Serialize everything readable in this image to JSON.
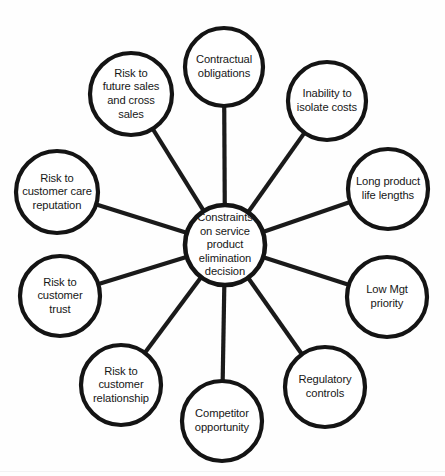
{
  "diagram": {
    "type": "spider-hub-and-spoke",
    "title": "Constraints on service product elimination decision",
    "background_color": "#fefefe",
    "stroke_color": "#141414",
    "text_color": "#171717",
    "width": 445,
    "height": 476,
    "center": {
      "id": "center",
      "label": "Constraints\non service\nproduct\nelimination\ndecision",
      "cx": 225,
      "cy": 245,
      "r": 40
    },
    "nodes": [
      {
        "id": "contractual-obligations",
        "label": "Contractual\nobligations",
        "cx": 224,
        "cy": 67,
        "r": 39,
        "position": "top"
      },
      {
        "id": "inability-to-isolate-costs",
        "label": "Inability to\nisolate costs",
        "cx": 327,
        "cy": 101,
        "r": 39,
        "position": "top-right"
      },
      {
        "id": "long-product-life-lengths",
        "label": "Long product\nlife lengths",
        "cx": 388,
        "cy": 189,
        "r": 40,
        "position": "right-upper"
      },
      {
        "id": "low-mgt-priority",
        "label": "Low Mgt\npriority",
        "cx": 387,
        "cy": 297,
        "r": 40,
        "position": "right-lower"
      },
      {
        "id": "regulatory-controls",
        "label": "Regulatory\ncontrols",
        "cx": 325,
        "cy": 387,
        "r": 40,
        "position": "bottom-right"
      },
      {
        "id": "competitor-opportunity",
        "label": "Competitor\nopportunity",
        "cx": 222,
        "cy": 421,
        "r": 40,
        "position": "bottom"
      },
      {
        "id": "risk-to-customer-relationship",
        "label": "Risk to\ncustomer\nrelationship",
        "cx": 121,
        "cy": 385,
        "r": 40,
        "position": "bottom-left"
      },
      {
        "id": "risk-to-customer-trust",
        "label": "Risk to\ncustomer\ntrust",
        "cx": 60,
        "cy": 296,
        "r": 40,
        "position": "left-lower"
      },
      {
        "id": "risk-to-customer-care-reputation",
        "label": "Risk to\ncustomer care\nreputation",
        "cx": 57,
        "cy": 192,
        "r": 41,
        "position": "left-upper"
      },
      {
        "id": "risk-to-future-sales-and-cross-sales",
        "label": "Risk to\nfuture sales\nand cross\nsales",
        "cx": 131,
        "cy": 94,
        "r": 41,
        "position": "top-left"
      }
    ],
    "edges": [
      {
        "id": "edge-contractual-obligations",
        "from": "center",
        "to": "contractual-obligations"
      },
      {
        "id": "edge-inability-to-isolate-costs",
        "from": "center",
        "to": "inability-to-isolate-costs"
      },
      {
        "id": "edge-long-product-life-lengths",
        "from": "center",
        "to": "long-product-life-lengths"
      },
      {
        "id": "edge-low-mgt-priority",
        "from": "center",
        "to": "low-mgt-priority"
      },
      {
        "id": "edge-regulatory-controls",
        "from": "center",
        "to": "regulatory-controls"
      },
      {
        "id": "edge-competitor-opportunity",
        "from": "center",
        "to": "competitor-opportunity"
      },
      {
        "id": "edge-risk-to-customer-relationship",
        "from": "center",
        "to": "risk-to-customer-relationship"
      },
      {
        "id": "edge-risk-to-customer-trust",
        "from": "center",
        "to": "risk-to-customer-trust"
      },
      {
        "id": "edge-risk-to-customer-care-reputation",
        "from": "center",
        "to": "risk-to-customer-care-reputation"
      },
      {
        "id": "edge-risk-to-future-sales-and-cross-sales",
        "from": "center",
        "to": "risk-to-future-sales-and-cross-sales"
      }
    ]
  }
}
